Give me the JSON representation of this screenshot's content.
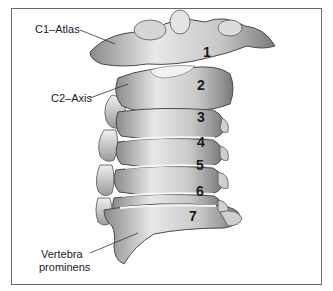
{
  "figure": {
    "labels": {
      "c1": "C1–Atlas",
      "c2": "C2–Axis",
      "c7_line1": "Vertebra",
      "c7_line2": "prominens"
    },
    "vertebra_numbers": [
      "1",
      "2",
      "3",
      "4",
      "5",
      "6",
      "7"
    ],
    "colors": {
      "border": "#6b6b6b",
      "bone_light": "#e6e6e6",
      "bone_mid": "#b5b5b5",
      "bone_dark": "#6e6e6e",
      "text": "#222222"
    }
  }
}
